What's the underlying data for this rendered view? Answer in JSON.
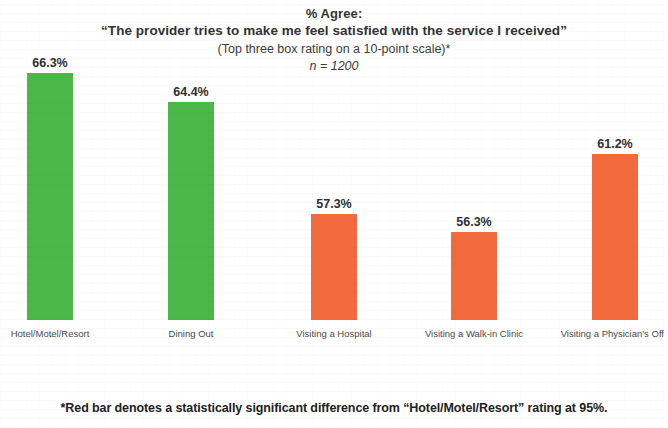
{
  "title": {
    "line1": "% Agree:",
    "line2": "“The provider tries to make me feel satisfied with the service I received”",
    "subtitle": "(Top three box rating on a 10-point scale)*",
    "sample_size": "n = 1200"
  },
  "footnote": {
    "text": "*Red bar denotes a statistically significant difference from “Hotel/Motel/Resort” rating at 95%."
  },
  "colors": {
    "green": "#4CB847",
    "orange": "#F26B3E",
    "text": "#2b2b2b",
    "background": "#ffffff"
  },
  "chart_data": {
    "type": "bar",
    "title": "% Agree: “The provider tries to make me feel satisfied with the service I received”",
    "subtitle": "(Top three box rating on a 10-point scale)*",
    "annotation": "n = 1200",
    "xlabel": "",
    "ylabel": "",
    "ylim": [
      0,
      100
    ],
    "grid": false,
    "legend": false,
    "categories": [
      "Hotel/Motel/Resort",
      "Dining Out",
      "Visiting a Hospital",
      "Visiting a Walk-in Clinic",
      "Visiting a Physician's Off"
    ],
    "values": [
      66.3,
      64.4,
      57.3,
      56.3,
      61.2
    ],
    "value_labels": [
      "66.3%",
      "64.4%",
      "57.3%",
      "56.3%",
      "61.2%"
    ],
    "bar_colors": [
      "#4CB847",
      "#4CB847",
      "#F26B3E",
      "#F26B3E",
      "#F26B3E"
    ],
    "bars": [
      {
        "label": "Hotel/Motel/Resort",
        "value": 66.3,
        "value_label": "66.3%",
        "color": "#4CB847",
        "left": 27,
        "width": 46,
        "height": 247
      },
      {
        "label": "Dining Out",
        "value": 64.4,
        "value_label": "64.4%",
        "color": "#4CB847",
        "left": 168,
        "width": 46,
        "height": 218
      },
      {
        "label": "Visiting a Hospital",
        "value": 57.3,
        "value_label": "57.3%",
        "color": "#F26B3E",
        "left": 311,
        "width": 46,
        "height": 106
      },
      {
        "label": "Visiting a Walk-in Clinic",
        "value": 56.3,
        "value_label": "56.3%",
        "color": "#F26B3E",
        "left": 451,
        "width": 46,
        "height": 88
      },
      {
        "label": "Visiting a Physician's Off",
        "value": 61.2,
        "value_label": "61.2%",
        "color": "#F26B3E",
        "left": 592,
        "width": 46,
        "height": 166
      }
    ]
  }
}
